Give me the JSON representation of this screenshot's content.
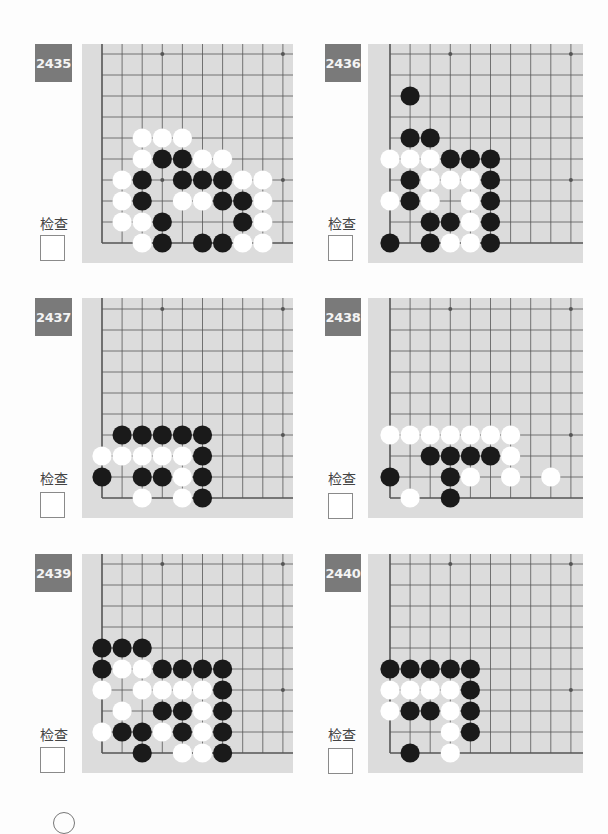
{
  "check_label": "检查",
  "colors": {
    "badge": "#7a7a7a",
    "board": "#dcdcdc",
    "line": "#555555",
    "black_stone": "#1a1a1a",
    "white_stone": "#ffffff"
  },
  "problems": [
    {
      "number": "2435",
      "stones": [
        {
          "c": 2,
          "r": 5,
          "color": "white"
        },
        {
          "c": 3,
          "r": 5,
          "color": "white"
        },
        {
          "c": 4,
          "r": 5,
          "color": "white"
        },
        {
          "c": 2,
          "r": 4,
          "color": "white"
        },
        {
          "c": 3,
          "r": 4,
          "color": "black"
        },
        {
          "c": 4,
          "r": 4,
          "color": "black"
        },
        {
          "c": 5,
          "r": 4,
          "color": "white"
        },
        {
          "c": 6,
          "r": 4,
          "color": "white"
        },
        {
          "c": 1,
          "r": 3,
          "color": "white"
        },
        {
          "c": 2,
          "r": 3,
          "color": "black"
        },
        {
          "c": 4,
          "r": 3,
          "color": "black"
        },
        {
          "c": 5,
          "r": 3,
          "color": "black"
        },
        {
          "c": 6,
          "r": 3,
          "color": "black"
        },
        {
          "c": 7,
          "r": 3,
          "color": "white"
        },
        {
          "c": 8,
          "r": 3,
          "color": "white"
        },
        {
          "c": 1,
          "r": 2,
          "color": "white"
        },
        {
          "c": 2,
          "r": 2,
          "color": "black"
        },
        {
          "c": 4,
          "r": 2,
          "color": "white"
        },
        {
          "c": 5,
          "r": 2,
          "color": "white"
        },
        {
          "c": 6,
          "r": 2,
          "color": "black"
        },
        {
          "c": 7,
          "r": 2,
          "color": "black"
        },
        {
          "c": 8,
          "r": 2,
          "color": "white"
        },
        {
          "c": 1,
          "r": 1,
          "color": "white"
        },
        {
          "c": 2,
          "r": 1,
          "color": "white"
        },
        {
          "c": 3,
          "r": 1,
          "color": "black"
        },
        {
          "c": 7,
          "r": 1,
          "color": "black"
        },
        {
          "c": 8,
          "r": 1,
          "color": "white"
        },
        {
          "c": 2,
          "r": 0,
          "color": "white"
        },
        {
          "c": 3,
          "r": 0,
          "color": "black"
        },
        {
          "c": 5,
          "r": 0,
          "color": "black"
        },
        {
          "c": 6,
          "r": 0,
          "color": "black"
        },
        {
          "c": 7,
          "r": 0,
          "color": "white"
        },
        {
          "c": 8,
          "r": 0,
          "color": "white"
        }
      ]
    },
    {
      "number": "2436",
      "stones": [
        {
          "c": 1,
          "r": 7,
          "color": "black"
        },
        {
          "c": 1,
          "r": 5,
          "color": "black"
        },
        {
          "c": 2,
          "r": 5,
          "color": "black"
        },
        {
          "c": 0,
          "r": 4,
          "color": "white"
        },
        {
          "c": 1,
          "r": 4,
          "color": "white"
        },
        {
          "c": 2,
          "r": 4,
          "color": "white"
        },
        {
          "c": 3,
          "r": 4,
          "color": "black"
        },
        {
          "c": 4,
          "r": 4,
          "color": "black"
        },
        {
          "c": 5,
          "r": 4,
          "color": "black"
        },
        {
          "c": 1,
          "r": 3,
          "color": "black"
        },
        {
          "c": 2,
          "r": 3,
          "color": "white"
        },
        {
          "c": 3,
          "r": 3,
          "color": "white"
        },
        {
          "c": 4,
          "r": 3,
          "color": "white"
        },
        {
          "c": 5,
          "r": 3,
          "color": "black"
        },
        {
          "c": 0,
          "r": 2,
          "color": "white"
        },
        {
          "c": 1,
          "r": 2,
          "color": "black"
        },
        {
          "c": 2,
          "r": 2,
          "color": "white"
        },
        {
          "c": 4,
          "r": 2,
          "color": "white"
        },
        {
          "c": 5,
          "r": 2,
          "color": "black"
        },
        {
          "c": 2,
          "r": 1,
          "color": "black"
        },
        {
          "c": 3,
          "r": 1,
          "color": "black"
        },
        {
          "c": 4,
          "r": 1,
          "color": "white"
        },
        {
          "c": 5,
          "r": 1,
          "color": "black"
        },
        {
          "c": 0,
          "r": 0,
          "color": "black"
        },
        {
          "c": 2,
          "r": 0,
          "color": "black"
        },
        {
          "c": 3,
          "r": 0,
          "color": "white"
        },
        {
          "c": 4,
          "r": 0,
          "color": "white"
        },
        {
          "c": 5,
          "r": 0,
          "color": "black"
        }
      ]
    },
    {
      "number": "2437",
      "stones": [
        {
          "c": 1,
          "r": 3,
          "color": "black"
        },
        {
          "c": 2,
          "r": 3,
          "color": "black"
        },
        {
          "c": 3,
          "r": 3,
          "color": "black"
        },
        {
          "c": 4,
          "r": 3,
          "color": "black"
        },
        {
          "c": 5,
          "r": 3,
          "color": "black"
        },
        {
          "c": 0,
          "r": 2,
          "color": "white"
        },
        {
          "c": 1,
          "r": 2,
          "color": "white"
        },
        {
          "c": 2,
          "r": 2,
          "color": "white"
        },
        {
          "c": 3,
          "r": 2,
          "color": "white"
        },
        {
          "c": 4,
          "r": 2,
          "color": "white"
        },
        {
          "c": 5,
          "r": 2,
          "color": "black"
        },
        {
          "c": 0,
          "r": 1,
          "color": "black"
        },
        {
          "c": 2,
          "r": 1,
          "color": "black"
        },
        {
          "c": 3,
          "r": 1,
          "color": "black"
        },
        {
          "c": 4,
          "r": 1,
          "color": "white"
        },
        {
          "c": 5,
          "r": 1,
          "color": "black"
        },
        {
          "c": 2,
          "r": 0,
          "color": "white"
        },
        {
          "c": 4,
          "r": 0,
          "color": "white"
        },
        {
          "c": 5,
          "r": 0,
          "color": "black"
        }
      ]
    },
    {
      "number": "2438",
      "stones": [
        {
          "c": 0,
          "r": 3,
          "color": "white"
        },
        {
          "c": 1,
          "r": 3,
          "color": "white"
        },
        {
          "c": 2,
          "r": 3,
          "color": "white"
        },
        {
          "c": 3,
          "r": 3,
          "color": "white"
        },
        {
          "c": 4,
          "r": 3,
          "color": "white"
        },
        {
          "c": 5,
          "r": 3,
          "color": "white"
        },
        {
          "c": 6,
          "r": 3,
          "color": "white"
        },
        {
          "c": 2,
          "r": 2,
          "color": "black"
        },
        {
          "c": 3,
          "r": 2,
          "color": "black"
        },
        {
          "c": 4,
          "r": 2,
          "color": "black"
        },
        {
          "c": 5,
          "r": 2,
          "color": "black"
        },
        {
          "c": 6,
          "r": 2,
          "color": "white"
        },
        {
          "c": 0,
          "r": 1,
          "color": "black"
        },
        {
          "c": 3,
          "r": 1,
          "color": "black"
        },
        {
          "c": 4,
          "r": 1,
          "color": "white"
        },
        {
          "c": 6,
          "r": 1,
          "color": "white"
        },
        {
          "c": 8,
          "r": 1,
          "color": "white"
        },
        {
          "c": 1,
          "r": 0,
          "color": "white"
        },
        {
          "c": 3,
          "r": 0,
          "color": "black"
        }
      ]
    },
    {
      "number": "2439",
      "stones": [
        {
          "c": 0,
          "r": 5,
          "color": "black"
        },
        {
          "c": 1,
          "r": 5,
          "color": "black"
        },
        {
          "c": 2,
          "r": 5,
          "color": "black"
        },
        {
          "c": 0,
          "r": 4,
          "color": "black"
        },
        {
          "c": 1,
          "r": 4,
          "color": "white"
        },
        {
          "c": 2,
          "r": 4,
          "color": "white"
        },
        {
          "c": 3,
          "r": 4,
          "color": "black"
        },
        {
          "c": 4,
          "r": 4,
          "color": "black"
        },
        {
          "c": 5,
          "r": 4,
          "color": "black"
        },
        {
          "c": 6,
          "r": 4,
          "color": "black"
        },
        {
          "c": 0,
          "r": 3,
          "color": "white"
        },
        {
          "c": 2,
          "r": 3,
          "color": "white"
        },
        {
          "c": 3,
          "r": 3,
          "color": "white"
        },
        {
          "c": 4,
          "r": 3,
          "color": "white"
        },
        {
          "c": 5,
          "r": 3,
          "color": "white"
        },
        {
          "c": 6,
          "r": 3,
          "color": "black"
        },
        {
          "c": 1,
          "r": 2,
          "color": "white"
        },
        {
          "c": 3,
          "r": 2,
          "color": "black"
        },
        {
          "c": 4,
          "r": 2,
          "color": "black"
        },
        {
          "c": 5,
          "r": 2,
          "color": "white"
        },
        {
          "c": 6,
          "r": 2,
          "color": "black"
        },
        {
          "c": 0,
          "r": 1,
          "color": "white"
        },
        {
          "c": 1,
          "r": 1,
          "color": "black"
        },
        {
          "c": 2,
          "r": 1,
          "color": "black"
        },
        {
          "c": 3,
          "r": 1,
          "color": "white"
        },
        {
          "c": 4,
          "r": 1,
          "color": "black"
        },
        {
          "c": 5,
          "r": 1,
          "color": "white"
        },
        {
          "c": 6,
          "r": 1,
          "color": "black"
        },
        {
          "c": 2,
          "r": 0,
          "color": "black"
        },
        {
          "c": 4,
          "r": 0,
          "color": "white"
        },
        {
          "c": 5,
          "r": 0,
          "color": "white"
        },
        {
          "c": 6,
          "r": 0,
          "color": "black"
        }
      ]
    },
    {
      "number": "2440",
      "stones": [
        {
          "c": 0,
          "r": 4,
          "color": "black"
        },
        {
          "c": 1,
          "r": 4,
          "color": "black"
        },
        {
          "c": 2,
          "r": 4,
          "color": "black"
        },
        {
          "c": 3,
          "r": 4,
          "color": "black"
        },
        {
          "c": 4,
          "r": 4,
          "color": "black"
        },
        {
          "c": 0,
          "r": 3,
          "color": "white"
        },
        {
          "c": 1,
          "r": 3,
          "color": "white"
        },
        {
          "c": 2,
          "r": 3,
          "color": "white"
        },
        {
          "c": 3,
          "r": 3,
          "color": "white"
        },
        {
          "c": 4,
          "r": 3,
          "color": "black"
        },
        {
          "c": 0,
          "r": 2,
          "color": "white"
        },
        {
          "c": 1,
          "r": 2,
          "color": "black"
        },
        {
          "c": 2,
          "r": 2,
          "color": "black"
        },
        {
          "c": 3,
          "r": 2,
          "color": "white"
        },
        {
          "c": 4,
          "r": 2,
          "color": "black"
        },
        {
          "c": 3,
          "r": 1,
          "color": "white"
        },
        {
          "c": 4,
          "r": 1,
          "color": "black"
        },
        {
          "c": 1,
          "r": 0,
          "color": "black"
        },
        {
          "c": 3,
          "r": 0,
          "color": "white"
        }
      ]
    }
  ],
  "star_points": [
    {
      "c": 3,
      "r": 9
    },
    {
      "c": 9,
      "r": 9
    },
    {
      "c": 9,
      "r": 3
    },
    {
      "c": 3,
      "r": 3
    }
  ]
}
